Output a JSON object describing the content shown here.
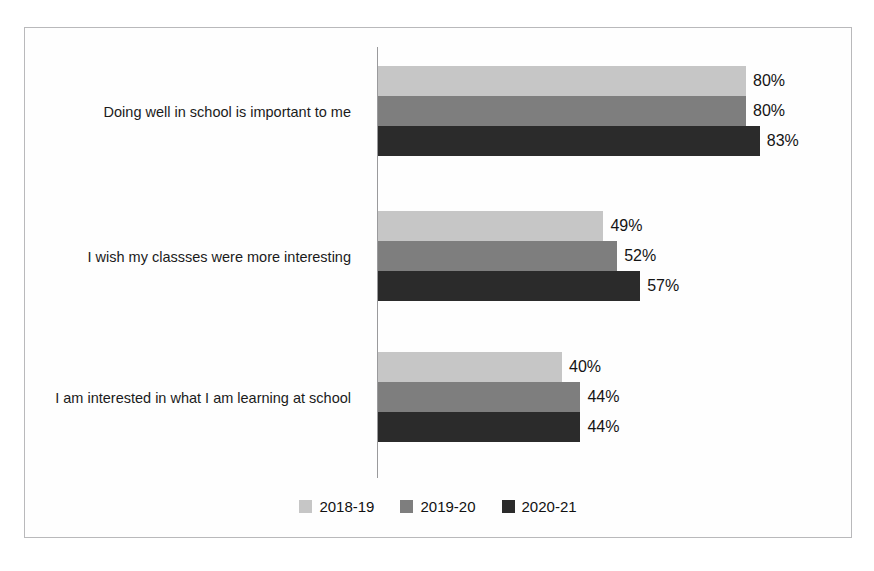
{
  "chart_data": {
    "type": "bar",
    "orientation": "horizontal",
    "title": "",
    "subtitle": "",
    "xlabel": "",
    "ylabel": "",
    "xlim": [
      0,
      100
    ],
    "grid": false,
    "legend_position": "bottom",
    "value_suffix": "%",
    "categories": [
      "Doing well in school is important to me",
      "I wish my classses were more interesting",
      "I am interested in what I am learning at school"
    ],
    "series": [
      {
        "name": "2018-19",
        "color": "#c6c6c6",
        "values": [
          80,
          49,
          40
        ],
        "labels": [
          "80%",
          "49%",
          "40%"
        ]
      },
      {
        "name": "2019-20",
        "color": "#7e7e7e",
        "values": [
          80,
          52,
          44
        ],
        "labels": [
          "80%",
          "52%",
          "44%"
        ]
      },
      {
        "name": "2020-21",
        "color": "#2b2b2b",
        "values": [
          83,
          57,
          44
        ],
        "labels": [
          "83%",
          "57%",
          "44%"
        ]
      }
    ]
  },
  "legend": {
    "items": [
      {
        "label": "2018-19"
      },
      {
        "label": "2019-20"
      },
      {
        "label": "2020-21"
      }
    ]
  }
}
